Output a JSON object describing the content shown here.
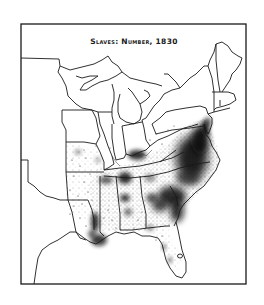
{
  "map": {
    "title": "Slaves: Number, 1830",
    "type": "dot-density",
    "region": "Eastern United States",
    "year": "1830",
    "colors": {
      "background": "#ffffff",
      "ink": "#1a1a1a",
      "dense": "#111111"
    }
  }
}
